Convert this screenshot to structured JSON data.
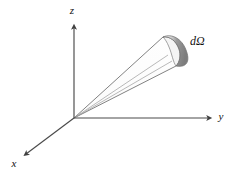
{
  "figure": {
    "background_color": "#ffffff",
    "line_color": "#5a5a5a",
    "axis_color": "#4a4a4a",
    "text_color": "#111111",
    "cap_fill_color": "#8a8a8a",
    "cap_highlight_color": "#f2f2f2",
    "cone_fill_color": "#fdfdfd"
  },
  "axes": [
    {
      "id": "z",
      "label": "z",
      "direction": "up",
      "label_x": 72,
      "label_y": 14,
      "from_x": 74,
      "from_y": 118,
      "to_x": 74,
      "to_y": 26
    },
    {
      "id": "y",
      "label": "y",
      "direction": "right",
      "label_x": 221,
      "label_y": 120,
      "from_x": 74,
      "from_y": 118,
      "to_x": 210,
      "to_y": 118
    },
    {
      "id": "x",
      "label": "x",
      "direction": "down-left",
      "label_x": 14,
      "label_y": 167,
      "from_x": 74,
      "from_y": 118,
      "to_x": 25,
      "to_y": 155
    }
  ],
  "annotations": [
    {
      "id": "solid-angle",
      "label": "dΩ",
      "label_x": 190,
      "label_y": 45
    }
  ],
  "cone": {
    "apex_x": 74,
    "apex_y": 118,
    "upper_edge_to_x": 163,
    "upper_edge_to_y": 37,
    "lower_edge_to_x": 176,
    "lower_edge_to_y": 66,
    "inner_line_1_to_x": 168,
    "inner_line_1_to_y": 55,
    "inner_line_2_to_x": 172,
    "inner_line_2_to_y": 61
  }
}
